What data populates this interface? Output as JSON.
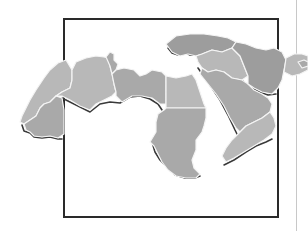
{
  "figure": {
    "colors": {
      "background": "#ffffff",
      "frame": "#2a2a2a",
      "land": "#a9a9a9",
      "border_lines": "#f4f4f4",
      "coast_shadow": "#3a3a3a",
      "right_rule": "#c8c8c8"
    },
    "frame_box": {
      "x": 63,
      "y": 18,
      "width": 215,
      "height": 199
    },
    "right_rule_x": 296,
    "regions": [
      {
        "name": "morocco-western-sahara"
      },
      {
        "name": "mauritania"
      },
      {
        "name": "algeria"
      },
      {
        "name": "tunisia"
      },
      {
        "name": "libya"
      },
      {
        "name": "egypt"
      },
      {
        "name": "sudan"
      },
      {
        "name": "turkey"
      },
      {
        "name": "syria-iraq"
      },
      {
        "name": "arabian-peninsula"
      },
      {
        "name": "yemen-oman"
      },
      {
        "name": "iran"
      },
      {
        "name": "eastern-fragment"
      }
    ]
  }
}
